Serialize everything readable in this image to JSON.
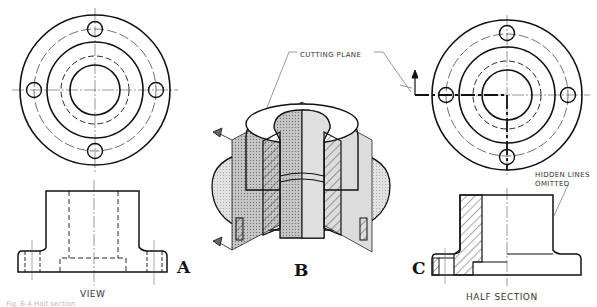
{
  "figure": {
    "panels": [
      {
        "id": "A",
        "letter": "A",
        "caption": "VIEW"
      },
      {
        "id": "B",
        "letter": "B",
        "callout": "CUTTING PLANE"
      },
      {
        "id": "C",
        "letter": "C",
        "caption": "HALF SECTION",
        "note_line1": "HIDDEN LINES",
        "note_line2": "OMITTED"
      }
    ],
    "bottom_caption": "Fig. 6-4  Half section"
  },
  "colors": {
    "line": "#111111",
    "thin": "#444444",
    "shade_dark": "#8a8a8a",
    "shade_light": "#cfcfcf",
    "background": "#ffffff"
  }
}
